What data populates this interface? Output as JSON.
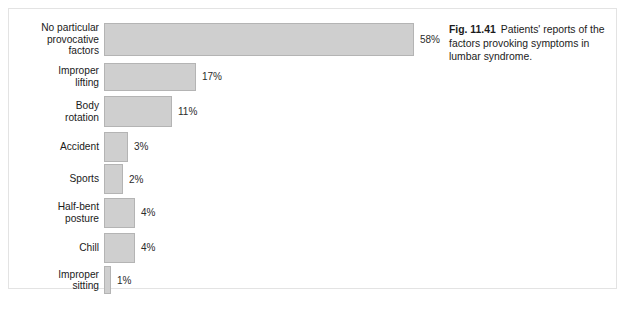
{
  "figure": {
    "caption_label": "Fig. 11.41",
    "caption_text": "Patients' reports of the factors provoking symptoms in lumbar syndrome."
  },
  "colors": {
    "bar_fill": "#cfcfcf",
    "bar_border": "#b4b4b4",
    "frame": "#e3e3e3",
    "text": "#1a1a1a",
    "background": "#ffffff"
  },
  "chart_data": {
    "type": "bar",
    "orientation": "horizontal",
    "title": "",
    "subtitle": "",
    "xlabel": "",
    "ylabel": "",
    "xlim": [
      0,
      58
    ],
    "grid": false,
    "legend": null,
    "unit": "%",
    "categories": [
      "No particular\nprovocative\nfactors",
      "Improper\nlifting",
      "Body\nrotation",
      "Accident",
      "Sports",
      "Half-bent\nposture",
      "Chill",
      "Improper\nsitting"
    ],
    "values": [
      58,
      17,
      11,
      3,
      2,
      4,
      4,
      1
    ],
    "data_labels": [
      "58%",
      "17%",
      "11%",
      "3%",
      "2%",
      "4%",
      "4%",
      "1%"
    ],
    "series": [
      {
        "name": "Share of patients",
        "values": [
          58,
          17,
          11,
          3,
          2,
          4,
          4,
          1
        ]
      }
    ],
    "rows": [
      {
        "label": "No particular\nprovocative\nfactors",
        "value": 58,
        "label_text": "58%",
        "bar_px": 310,
        "bar_h": 33,
        "row_h": 41
      },
      {
        "label": "Improper\nlifting",
        "value": 17,
        "label_text": "17%",
        "bar_px": 92,
        "bar_h": 28,
        "row_h": 33
      },
      {
        "label": "Body\nrotation",
        "value": 11,
        "label_text": "11%",
        "bar_px": 68,
        "bar_h": 31,
        "row_h": 37
      },
      {
        "label": "Accident",
        "value": 3,
        "label_text": "3%",
        "bar_px": 24,
        "bar_h": 30,
        "row_h": 33
      },
      {
        "label": "Sports",
        "value": 2,
        "label_text": "2%",
        "bar_px": 19,
        "bar_h": 30,
        "row_h": 32
      },
      {
        "label": "Half-bent\nposture",
        "value": 4,
        "label_text": "4%",
        "bar_px": 31,
        "bar_h": 30,
        "row_h": 35
      },
      {
        "label": "Chill",
        "value": 4,
        "label_text": "4%",
        "bar_px": 31,
        "bar_h": 30,
        "row_h": 35
      },
      {
        "label": "Improper\nsitting",
        "value": 1,
        "label_text": "1%",
        "bar_px": 7,
        "bar_h": 28,
        "row_h": 30
      }
    ]
  }
}
